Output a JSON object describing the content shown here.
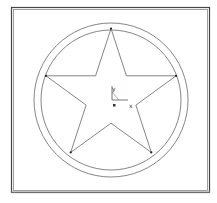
{
  "diagram": {
    "axes": {
      "x_label": "x",
      "y_label": "y",
      "origin_marker": "square"
    },
    "star": {
      "points": 5,
      "vertex_markers": true
    },
    "circles": {
      "count": 2,
      "concentric": true
    },
    "frame": {
      "style": "double-border"
    },
    "caption": "",
    "colors": {
      "line": "#555555",
      "frame": "#444444",
      "background": "#ffffff"
    }
  }
}
